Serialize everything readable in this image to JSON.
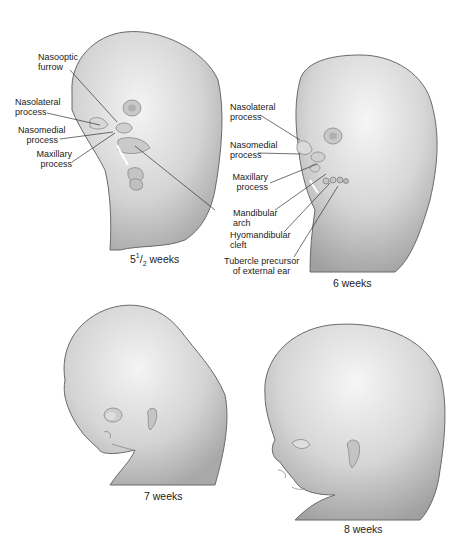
{
  "figures": [
    {
      "id": "5.5-weeks",
      "caption_main": "5",
      "caption_sup": "1",
      "caption_sub": "2",
      "caption_rest": " weeks",
      "labels": [
        {
          "line1": "Nasooptic",
          "line2": "furrow"
        },
        {
          "line1": "Nasolateral",
          "line2": "process"
        },
        {
          "line1": "Nasomedial",
          "line2": "process"
        },
        {
          "line1": "Maxillary",
          "line2": "process"
        }
      ]
    },
    {
      "id": "6-weeks",
      "caption": "6 weeks",
      "labels": [
        {
          "line1": "Nasolateral",
          "line2": "process"
        },
        {
          "line1": "Nasomedial",
          "line2": "process"
        },
        {
          "line1": "Maxillary",
          "line2": "process"
        },
        {
          "line1": "Mandibular",
          "line2": "arch"
        },
        {
          "line1": "Hyomandibular",
          "line2": "cleft"
        },
        {
          "line1": "Tubercle precursor",
          "line2": "of external ear"
        }
      ]
    },
    {
      "id": "7-weeks",
      "caption": "7 weeks"
    },
    {
      "id": "8-weeks",
      "caption": "8 weeks"
    }
  ],
  "colors": {
    "skin_light": "#f2f2f2",
    "skin_mid": "#cfcfcf",
    "skin_dark": "#9a9a9a",
    "outline": "#6a6a6a",
    "leader": "#333333"
  }
}
